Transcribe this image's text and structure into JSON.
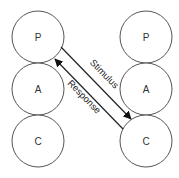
{
  "diagram": {
    "type": "transactional-analysis",
    "left_column": {
      "states": [
        {
          "label": "P",
          "cx": 38,
          "cy": 37
        },
        {
          "label": "A",
          "cx": 38,
          "cy": 89
        },
        {
          "label": "C",
          "cx": 38,
          "cy": 141
        }
      ]
    },
    "right_column": {
      "states": [
        {
          "label": "P",
          "cx": 146,
          "cy": 37
        },
        {
          "label": "A",
          "cx": 146,
          "cy": 89
        },
        {
          "label": "C",
          "cx": 146,
          "cy": 141
        }
      ]
    },
    "radius": 26,
    "edges": [
      {
        "label": "Stimulus",
        "from": "left.P",
        "to": "right.C"
      },
      {
        "label": "Response",
        "from": "right.C",
        "to": "left.P"
      }
    ]
  }
}
